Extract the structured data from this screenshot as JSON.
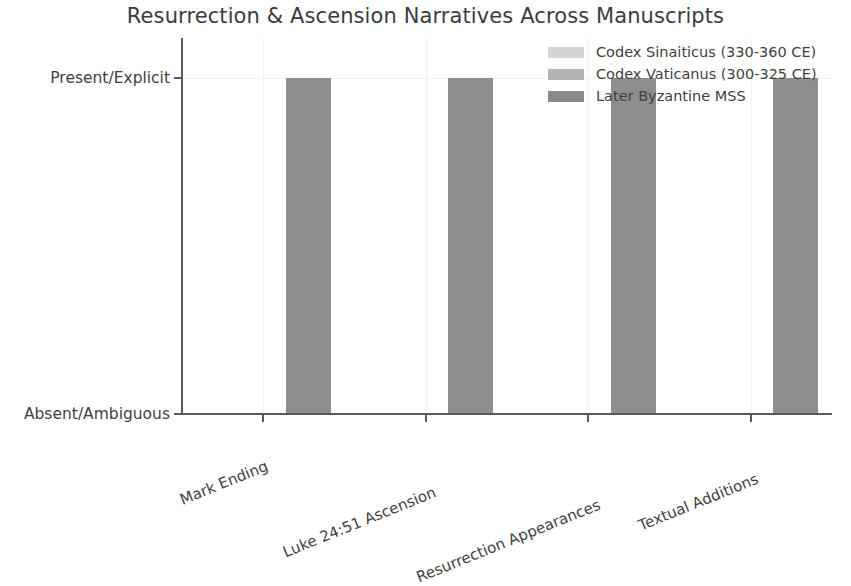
{
  "chart_data": {
    "type": "bar",
    "title": "Resurrection & Ascension Narratives Across Manuscripts",
    "xlabel": "",
    "ylabel": "",
    "categories": [
      "Mark Ending",
      "Luke 24:51 Ascension",
      "Resurrection Appearances",
      "Textual Additions"
    ],
    "ytick_labels": [
      "Absent/Ambiguous",
      "Present/Explicit"
    ],
    "ytick_values": [
      0,
      1
    ],
    "ylim": [
      0,
      1.12
    ],
    "grid": true,
    "legend_position": "upper right",
    "series": [
      {
        "name": "Codex Sinaiticus (330-360 CE)",
        "color": "#d4d4d4",
        "values": [
          0,
          0,
          0,
          0
        ]
      },
      {
        "name": "Codex Vaticanus (300-325 CE)",
        "color": "#b3b3b3",
        "values": [
          0,
          0,
          0,
          0
        ]
      },
      {
        "name": "Later Byzantine MSS",
        "color": "#8a8a8a",
        "values": [
          1,
          1,
          1,
          1
        ]
      }
    ]
  },
  "axis": {
    "ytick_bottom": "Absent/Ambiguous",
    "ytick_top": "Present/Explicit"
  },
  "legend": {
    "entries": [
      {
        "label": "Codex Sinaiticus (330-360 CE)",
        "color": "#d4d4d4"
      },
      {
        "label": "Codex Vaticanus (300-325 CE)",
        "color": "#b3b3b3"
      },
      {
        "label": "Later Byzantine MSS",
        "color": "#8a8a8a"
      }
    ]
  },
  "bars": {
    "fill": "#8e8e8e"
  }
}
